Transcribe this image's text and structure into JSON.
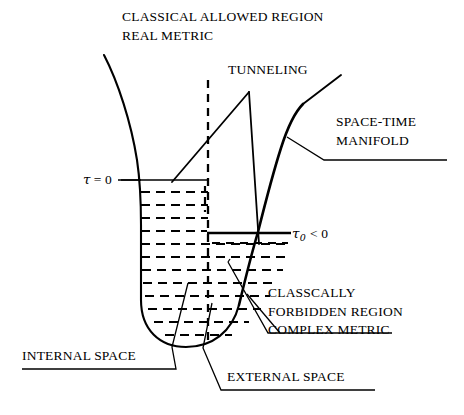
{
  "figure": {
    "title_block": {
      "line1": "CLASSICAL ALLOWED REGION",
      "line2": "REAL METRIC"
    },
    "labels": {
      "tunneling": "TUNNELING",
      "spacetime_line1": "SPACE-TIME",
      "spacetime_line2": "MANIFOLD",
      "forbidden_line1": "CLASSCALLY",
      "forbidden_line2": "FORBIDDEN REGION",
      "forbidden_line3": "COMPLEX METRIC",
      "internal_space": "INTERNAL SPACE",
      "external_space": "EXTERNAL SPACE"
    },
    "axis_markers": {
      "tau_zero": {
        "symbol": "τ",
        "relation": "= 0",
        "full": "τ = 0"
      },
      "tau_sub_zero": {
        "symbol": "τ",
        "subscript": "0",
        "relation": "< 0",
        "full": "τ₀ < 0"
      }
    },
    "colors": {
      "ink": "#000000",
      "background": "#ffffff"
    }
  }
}
